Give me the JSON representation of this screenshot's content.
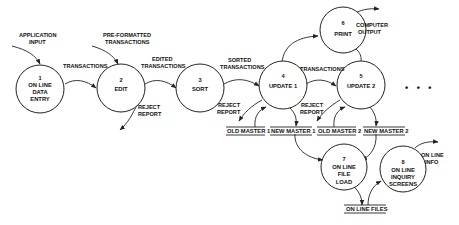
{
  "diagram": {
    "type": "data-flow-diagram",
    "processes": [
      {
        "id": "1",
        "number": "1",
        "lines": [
          "ON LINE",
          "DATA",
          "ENTRY"
        ]
      },
      {
        "id": "2",
        "number": "2",
        "lines": [
          "EDIT"
        ]
      },
      {
        "id": "3",
        "number": "3",
        "lines": [
          "SORT"
        ]
      },
      {
        "id": "4",
        "number": "4",
        "lines": [
          "UPDATE 1"
        ]
      },
      {
        "id": "5",
        "number": "5",
        "lines": [
          "UPDATE 2"
        ]
      },
      {
        "id": "6",
        "number": "6",
        "lines": [
          "PRINT"
        ]
      },
      {
        "id": "7",
        "number": "7",
        "lines": [
          "ON LINE",
          "FILE",
          "LOAD"
        ]
      },
      {
        "id": "8",
        "number": "8",
        "lines": [
          "ON LINE",
          "INQUIRY",
          "SCREENS"
        ]
      }
    ],
    "data_stores": [
      {
        "id": "old-master-1",
        "label": "OLD MASTER 1"
      },
      {
        "id": "new-master-1",
        "label": "NEW MASTER 1"
      },
      {
        "id": "old-master-2",
        "label": "OLD MASTER 2"
      },
      {
        "id": "new-master-2",
        "label": "NEW MASTER 2"
      },
      {
        "id": "on-line-files",
        "label": "ON LINE FILES"
      }
    ],
    "flow_labels": {
      "application_input": [
        "APPLICATION",
        "INPUT"
      ],
      "pre_formatted": [
        "PRE-FORMATTED",
        "TRANSACTIONS"
      ],
      "transactions_1_2": [
        "TRANSACTIONS"
      ],
      "edited": [
        "EDITED",
        "TRANSACTIONS"
      ],
      "sorted": [
        "SORTED",
        "TRANSACTIONS"
      ],
      "transactions_4_5": [
        "TRANSACTIONS"
      ],
      "reject_2": [
        "REJECT",
        "REPORT"
      ],
      "reject_4": [
        "REJECT",
        "REPORT"
      ],
      "reject_5": [
        "REJECT",
        "REPORT"
      ],
      "computer_output": [
        "COMPUTER",
        "OUTPUT"
      ],
      "online_info": [
        "ON LINE",
        "INFO"
      ]
    },
    "continuation": "• • •"
  }
}
